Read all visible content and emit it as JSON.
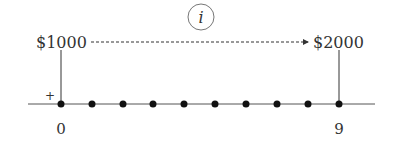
{
  "diagram": {
    "type": "cash-flow-timeline",
    "rate_label": "i",
    "present_value": {
      "label": "$1000",
      "period": 0
    },
    "future_value": {
      "label": "$2000",
      "period": 9
    },
    "sign_marker": "+",
    "periods": {
      "start": 0,
      "end": 9,
      "count": 10
    },
    "axis_labels": {
      "start": "0",
      "end": "9"
    },
    "colors": {
      "line": "#333333",
      "dot": "#111111",
      "text": "#333333",
      "background": "#ffffff"
    }
  }
}
